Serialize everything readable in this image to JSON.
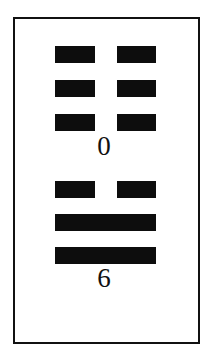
{
  "diagram": {
    "type": "trigram-pair-figure",
    "upper_group": {
      "lines": [
        "broken",
        "broken",
        "broken"
      ],
      "label": "0"
    },
    "lower_group": {
      "lines": [
        "broken",
        "solid",
        "solid"
      ],
      "label": "6"
    },
    "colors": {
      "line": "#0d0d0d",
      "border": "#111111",
      "background": "#ffffff"
    }
  }
}
